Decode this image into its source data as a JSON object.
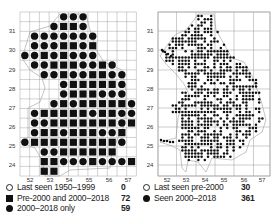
{
  "figure": {
    "left_map": {
      "name": "Breeding distribution by tetrad/grid (left)",
      "x_ticks": [
        "52",
        "53",
        "54",
        "55",
        "56",
        "57"
      ],
      "y_ticks": [
        "31",
        "30",
        "29",
        "28",
        "27",
        "26",
        "25",
        "24"
      ],
      "legend": [
        {
          "symbol": "open-circle",
          "label": "Last seen 1950–1999",
          "value": "0"
        },
        {
          "symbol": "filled-square",
          "label": "Pre-2000 and 2000–2018",
          "value": "72"
        },
        {
          "symbol": "filled-circle",
          "label": "2000–2018 only",
          "value": "59"
        }
      ],
      "grid": {
        "cols": 12,
        "rows": 17
      },
      "cells": [
        "....ccc.....",
        "...cssc.....",
        ".ccccccc....",
        ".cccsscs....",
        "ccscscc c...",
        ".ccsssccsc..",
        "..ccsccsscc.",
        "....csssssc.",
        "....csssccc.",
        "...cscsssssc",
        ".csssssc sscc",
        ".ccsssssssc s",
        ".cssc sssccs",
        "csssssssssc.",
        "..ccssssss..",
        "..sscccscccs",
        "..ss........"
      ]
    },
    "right_map": {
      "name": "Fine-scale distribution (right)",
      "x_ticks": [
        "52",
        "53",
        "54",
        "55",
        "56",
        "57"
      ],
      "y_ticks": [
        "31",
        "30",
        "29",
        "28",
        "27",
        "26",
        "25",
        "24"
      ],
      "legend": [
        {
          "symbol": "open-circle",
          "label": "Last seen pre-2000",
          "value": "30"
        },
        {
          "symbol": "filled-circle",
          "label": "Seen 2000–2018",
          "value": "361"
        }
      ]
    }
  },
  "chart_data": {
    "type": "map",
    "panels": [
      {
        "title": "",
        "xlabel": "",
        "ylabel": "",
        "x_ticks": [
          52,
          53,
          54,
          55,
          56,
          57
        ],
        "y_ticks": [
          31,
          30,
          29,
          28,
          27,
          26,
          25,
          24
        ],
        "grid": true,
        "series": [
          {
            "name": "Last seen 1950–1999",
            "marker": "open-circle",
            "count": 0
          },
          {
            "name": "Pre-2000 and 2000–2018",
            "marker": "filled-square",
            "count": 72
          },
          {
            "name": "2000–2018 only",
            "marker": "filled-circle",
            "count": 59
          }
        ],
        "legend_position": "bottom"
      },
      {
        "title": "",
        "xlabel": "",
        "ylabel": "",
        "x_ticks": [
          52,
          53,
          54,
          55,
          56,
          57
        ],
        "y_ticks": [
          31,
          30,
          29,
          28,
          27,
          26,
          25,
          24
        ],
        "grid": true,
        "series": [
          {
            "name": "Last seen pre-2000",
            "marker": "open-circle",
            "count": 30
          },
          {
            "name": "Seen 2000–2018",
            "marker": "filled-circle",
            "count": 361
          }
        ],
        "legend_position": "bottom"
      }
    ]
  },
  "colors": {
    "marker": "#111111",
    "grid": "#9a9a9a",
    "outline": "#b5b5b5",
    "text": "#222222"
  }
}
